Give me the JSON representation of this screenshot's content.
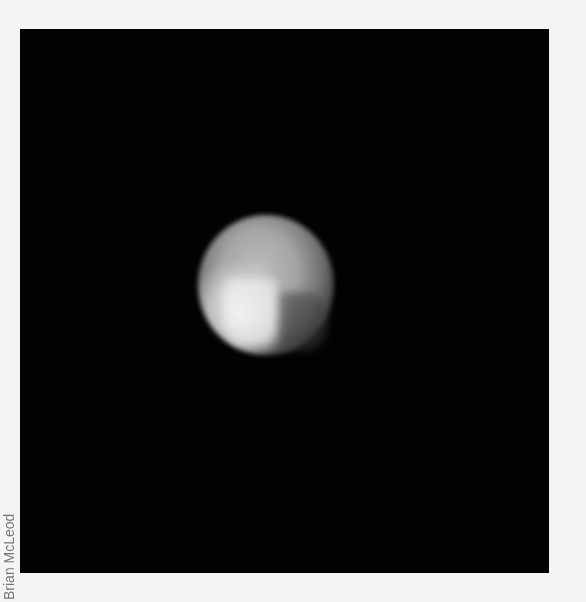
{
  "image": {
    "subject": "planet-disk",
    "background_color": "#020202",
    "page_color": "#f4f4f4",
    "credit": "Brian McLeod"
  }
}
